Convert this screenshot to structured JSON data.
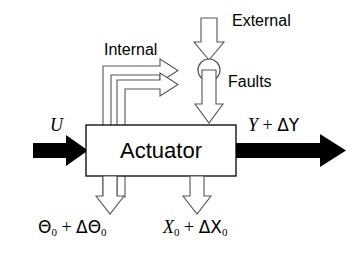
{
  "diagram": {
    "colors": {
      "stroke": "#000000",
      "fill": "#ffffff",
      "solid_arrow": "#000000",
      "hollow_arrow_stroke": "#555555",
      "background": "#ffffff"
    },
    "block": {
      "label": "Actuator"
    },
    "junction": {
      "name": "summing-junction",
      "shape": "circle"
    },
    "labels": {
      "internal": "Internal",
      "external": "External",
      "faults": "Faults",
      "input": "U",
      "output_var": "Y",
      "output_op": " + ",
      "output_delta": "ΔY",
      "theta_var": "Θ",
      "theta_sub": "0",
      "theta_op": " + ",
      "theta_delta": "ΔΘ",
      "theta_delta_sub": "0",
      "x_var": "X",
      "x_sub": "0",
      "x_op": " + ",
      "x_delta": "ΔX",
      "x_delta_sub": "0"
    },
    "arrows": {
      "input": "solid-right-arrow",
      "output": "solid-right-arrow",
      "external": "hollow-down-arrow",
      "fault_into_block": "hollow-down-arrow",
      "internal_upper": "hollow-right-arrow",
      "internal_lower": "hollow-right-arrow",
      "theta_out": "hollow-down-arrow",
      "x_out": "hollow-down-arrow"
    }
  }
}
